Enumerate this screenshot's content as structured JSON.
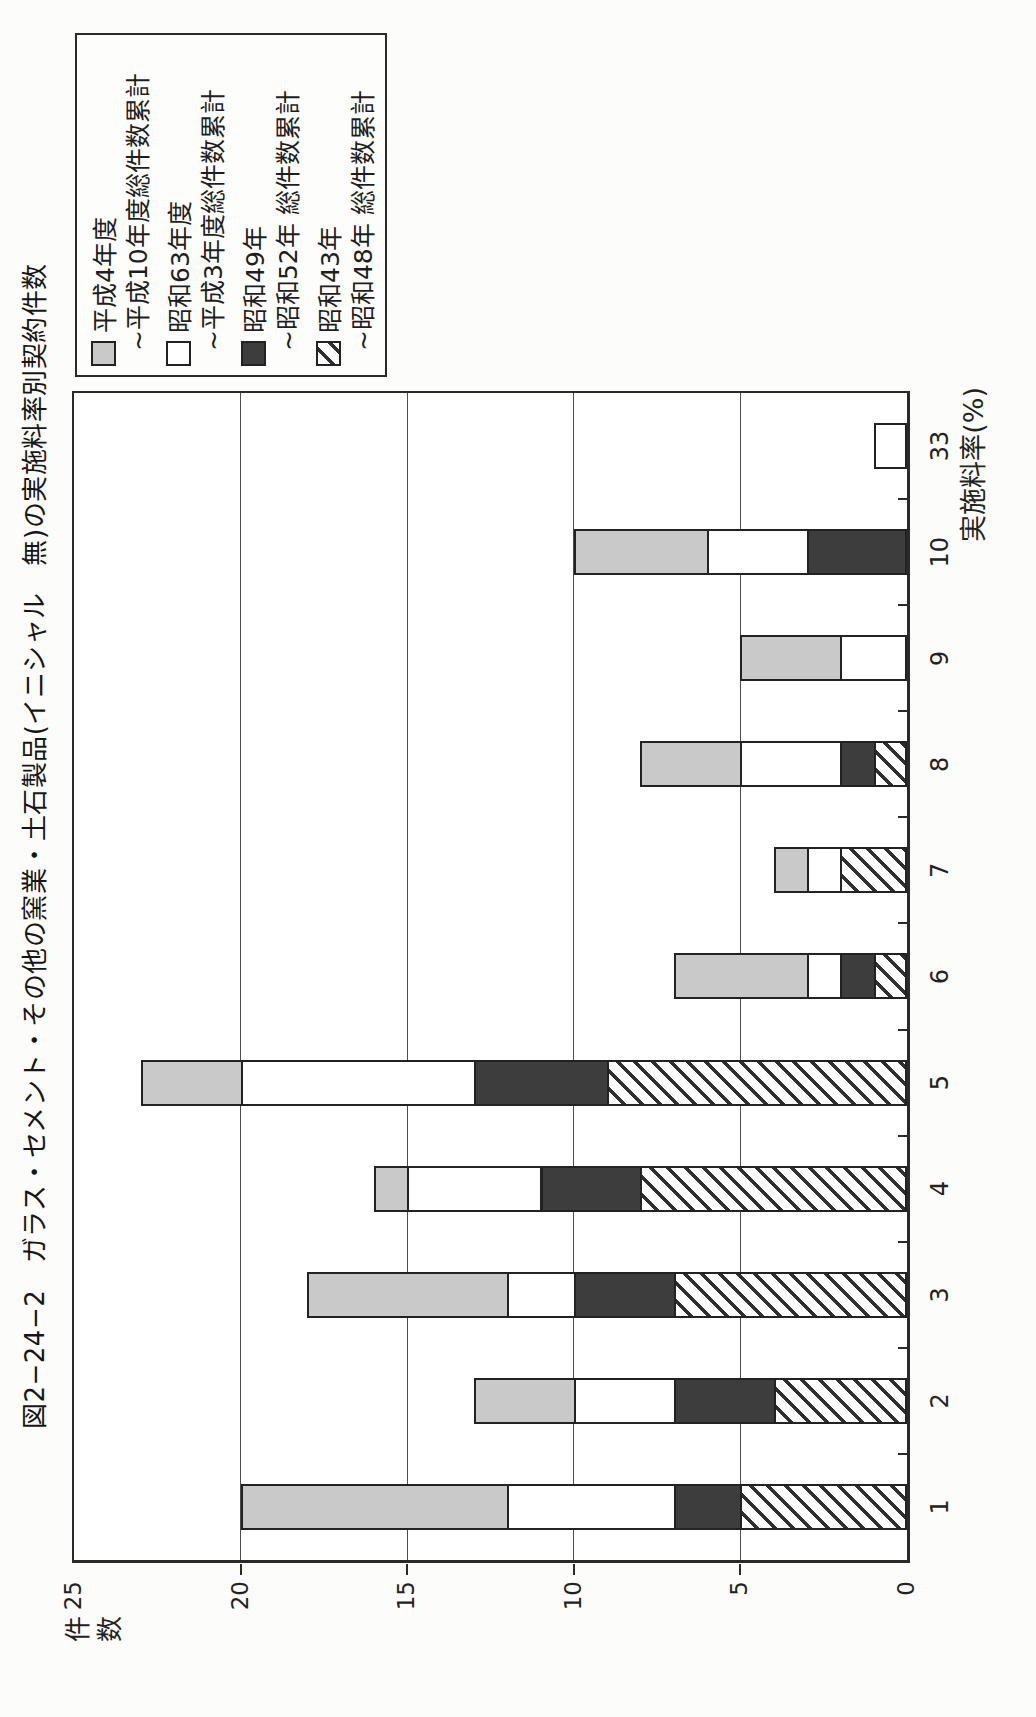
{
  "title": "図2−24−2　ガラス・セメント・その他の窯業・土石製品(イニシャル　無)の実施料率別契約件数",
  "y_axis": {
    "label": "件数",
    "ticks": [
      0,
      5,
      10,
      15,
      20,
      25
    ],
    "max": 25
  },
  "x_axis": {
    "label": "実施料率(%)"
  },
  "legend": {
    "entries": [
      {
        "swatch": "gray",
        "line1": "平成4年度",
        "line2": "~平成10年度総件数累計"
      },
      {
        "swatch": "white",
        "line1": "昭和63年度",
        "line2": "~平成3年度総件数累計"
      },
      {
        "swatch": "dark",
        "line1": "昭和49年",
        "line2": "~昭和52年 総件数累計"
      },
      {
        "swatch": "hatch",
        "line1": "昭和43年",
        "line2": "~昭和48年 総件数累計"
      }
    ]
  },
  "chart_data": {
    "type": "bar",
    "stacked": true,
    "orientation": "vertical bars; whole chart printed rotated 90° CCW on portrait page",
    "title": "図2−24−2　ガラス・セメント・その他の窯業・土石製品(イニシャル　無)の実施料率別契約件数",
    "xlabel": "実施料率(%)",
    "ylabel": "件数",
    "ylim": [
      0,
      25
    ],
    "gridlines": [
      5,
      10,
      15,
      20
    ],
    "grid": "horizontal lines at 5-unit intervals",
    "legend_position": "top-right outside plot",
    "categories": [
      "1",
      "2",
      "3",
      "4",
      "5",
      "6",
      "7",
      "8",
      "9",
      "10",
      "33"
    ],
    "series": [
      {
        "name": "昭和43年~昭和48年 総件数累計",
        "pattern": "hatch",
        "color": "diagonal black stripes on white",
        "values": [
          5,
          4,
          7,
          8,
          9,
          1,
          2,
          1,
          0,
          0,
          0
        ]
      },
      {
        "name": "昭和49年~昭和52年 総件数累計",
        "pattern": "dark",
        "color": "#3d3d3d",
        "values": [
          2,
          3,
          3,
          3,
          4,
          1,
          0,
          1,
          0,
          3,
          0
        ]
      },
      {
        "name": "昭和63年度~平成3年度総件数累計",
        "pattern": "white",
        "color": "#ffffff",
        "values": [
          5,
          3,
          2,
          4,
          7,
          1,
          1,
          3,
          2,
          3,
          1
        ]
      },
      {
        "name": "平成4年度~平成10年度総件数累計",
        "pattern": "gray",
        "color": "#c9c9c9",
        "values": [
          8,
          3,
          6,
          1,
          3,
          4,
          1,
          3,
          3,
          4,
          0
        ]
      }
    ],
    "totals": [
      20,
      13,
      18,
      16,
      23,
      7,
      4,
      8,
      5,
      10,
      1
    ]
  },
  "colors": {
    "line": "#2a2a2a",
    "gray_fill": "#c9c9c9",
    "dark_fill": "#3d3d3d",
    "background": "#fcfcfa"
  }
}
